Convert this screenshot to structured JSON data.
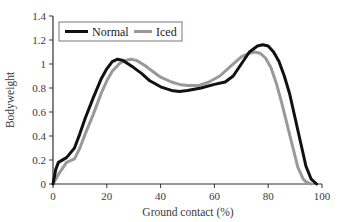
{
  "chart_data": {
    "type": "line",
    "title": "",
    "xlabel": "Ground contact (%)",
    "ylabel": "Bodyweight",
    "xlim": [
      0,
      100
    ],
    "ylim": [
      0,
      1.4
    ],
    "xticks": [
      0,
      20,
      40,
      60,
      80,
      100
    ],
    "yticks": [
      0,
      0.2,
      0.4,
      0.6,
      0.8,
      1,
      1.2,
      1.4
    ],
    "ytick_labels": [
      "0",
      "0.2",
      "0.4",
      "0.6",
      "0.8",
      "1",
      "1.2",
      "1.4"
    ],
    "grid": false,
    "legend_position": "top-left (inside)",
    "series": [
      {
        "name": "Normal",
        "color": "#111111",
        "x": [
          0,
          1,
          2,
          5,
          8,
          10,
          12,
          15,
          18,
          20,
          22,
          24,
          26,
          28,
          30,
          33,
          36,
          40,
          44,
          47,
          50,
          55,
          60,
          64,
          67,
          70,
          73,
          76,
          78,
          80,
          82,
          84,
          86,
          88,
          90,
          92,
          94,
          96,
          98
        ],
        "y": [
          0,
          0.12,
          0.18,
          0.22,
          0.3,
          0.42,
          0.55,
          0.72,
          0.88,
          0.96,
          1.02,
          1.04,
          1.03,
          1.0,
          0.97,
          0.92,
          0.86,
          0.81,
          0.78,
          0.77,
          0.78,
          0.8,
          0.83,
          0.85,
          0.9,
          1.0,
          1.1,
          1.15,
          1.16,
          1.15,
          1.1,
          1.02,
          0.9,
          0.75,
          0.55,
          0.35,
          0.15,
          0.04,
          0
        ]
      },
      {
        "name": "Iced",
        "color": "#999999",
        "x": [
          0,
          2,
          5,
          8,
          10,
          12,
          15,
          18,
          20,
          22,
          25,
          27,
          29,
          31,
          34,
          37,
          40,
          44,
          47,
          50,
          54,
          58,
          62,
          66,
          70,
          73,
          75,
          77,
          79,
          81,
          83,
          85,
          87,
          89,
          91,
          93,
          94,
          96
        ],
        "y": [
          0,
          0.08,
          0.18,
          0.21,
          0.3,
          0.42,
          0.58,
          0.76,
          0.86,
          0.94,
          1.01,
          1.03,
          1.04,
          1.03,
          0.99,
          0.94,
          0.89,
          0.85,
          0.83,
          0.82,
          0.82,
          0.85,
          0.9,
          0.98,
          1.06,
          1.09,
          1.1,
          1.09,
          1.05,
          0.97,
          0.84,
          0.68,
          0.5,
          0.32,
          0.14,
          0.04,
          0.02,
          0
        ]
      }
    ]
  }
}
